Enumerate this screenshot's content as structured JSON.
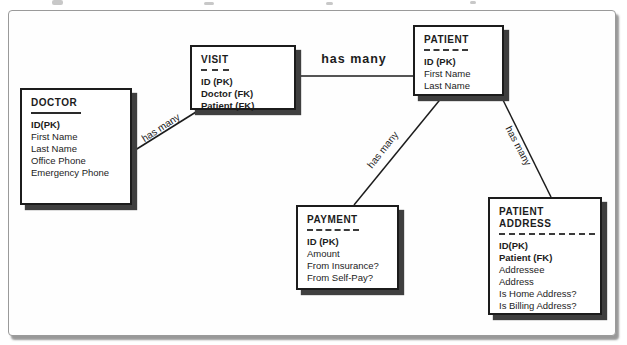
{
  "diagram": {
    "type": "entity-relationship",
    "entities": [
      {
        "name": "DOCTOR",
        "fields": [
          "ID(PK)",
          "First Name",
          "Last Name",
          "Office Phone",
          "Emergency Phone"
        ]
      },
      {
        "name": "VISIT",
        "fields": [
          "ID (PK)",
          "Doctor (FK)",
          "Patient (FK)"
        ]
      },
      {
        "name": "PATIENT",
        "fields": [
          "ID (PK)",
          "First Name",
          "Last Name"
        ]
      },
      {
        "name": "PAYMENT",
        "fields": [
          "ID (PK)",
          "Amount",
          "From Insurance?",
          "From Self-Pay?"
        ]
      },
      {
        "name": "PATIENT ADDRESS",
        "fields": [
          "ID(PK)",
          "Patient (FK)",
          "Addressee",
          "Address",
          "Is Home Address?",
          "Is Billing Address?"
        ]
      }
    ],
    "relationships": [
      {
        "from": "DOCTOR",
        "to": "VISIT",
        "label": "has many"
      },
      {
        "from": "VISIT",
        "to": "PATIENT",
        "label": "has many"
      },
      {
        "from": "PATIENT",
        "to": "PAYMENT",
        "label": "has many"
      },
      {
        "from": "PATIENT",
        "to": "PATIENT ADDRESS",
        "label": "has many"
      }
    ],
    "colors": {
      "ink": "#1c1c1c",
      "entity_shadow": "#3f3f3f",
      "frame_border": "#9a9a9a",
      "background": "#fefefe"
    }
  }
}
